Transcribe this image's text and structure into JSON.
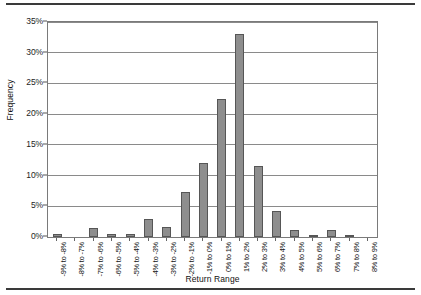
{
  "chart_data": {
    "type": "bar",
    "title": "",
    "xlabel": "Return Range",
    "ylabel": "Frequency",
    "ylim": [
      0,
      35
    ],
    "ytick_labels": [
      "0%",
      "5%",
      "10%",
      "15%",
      "20%",
      "25%",
      "30%",
      "35%"
    ],
    "ytick_values": [
      0,
      5,
      10,
      15,
      20,
      25,
      30,
      35
    ],
    "grid": true,
    "legend": false,
    "categories": [
      "-9% to -8%",
      "-8% to -7%",
      "-7% to -6%",
      "-6% to -5%",
      "-5% to -4%",
      "-4% to -3%",
      "-3% to -2%",
      "-2% to -1%",
      "-1% to 0%",
      "0% to 1%",
      "1% to 2%",
      "2% to 3%",
      "3% to 4%",
      "4% to 5%",
      "5% to 6%",
      "6% to 7%",
      "7% to 8%",
      "8% to 9%"
    ],
    "values": [
      0.5,
      0.0,
      1.5,
      0.5,
      0.5,
      3.0,
      1.6,
      7.3,
      12.1,
      22.5,
      33.0,
      11.6,
      4.3,
      1.1,
      0.4,
      1.1,
      0.4,
      0.0
    ],
    "bar_color": "#8e8e8e",
    "bar_edge_color": "#565656"
  },
  "axes": {
    "y_title": "Frequency",
    "x_title": "Return Range"
  }
}
